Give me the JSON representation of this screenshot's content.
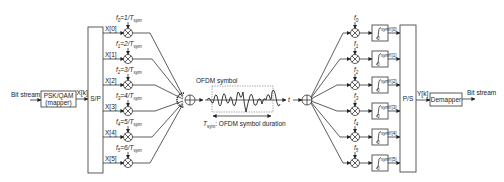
{
  "diagram": {
    "transmitter": {
      "input_label": "Bit stream",
      "mapper_line1": "PSK/QAM",
      "mapper_line2": "(mapper)",
      "mapper_output": "X[k]",
      "sp_label": "S/P",
      "subcarriers": [
        {
          "input": "X[0]",
          "freq": "f",
          "sub": "0",
          "eq": "=1/T",
          "tsub": "sym"
        },
        {
          "input": "X[1]",
          "freq": "f",
          "sub": "1",
          "eq": "=2/T",
          "tsub": "sym"
        },
        {
          "input": "X[2]",
          "freq": "f",
          "sub": "2",
          "eq": "=3/T",
          "tsub": "sym"
        },
        {
          "input": "X[3]",
          "freq": "f",
          "sub": "3",
          "eq": "=4/T",
          "tsub": "sym"
        },
        {
          "input": "X[4]",
          "freq": "f",
          "sub": "4",
          "eq": "=5/T",
          "tsub": "sym"
        },
        {
          "input": "X[5]",
          "freq": "f",
          "sub": "5",
          "eq": "=6/T",
          "tsub": "sym"
        }
      ]
    },
    "channel": {
      "symbol_label": "OFDM symbol",
      "duration_T": "T",
      "duration_sub": "sym",
      "duration_text": ": OFDM symbol duration",
      "time_axis": "t"
    },
    "receiver": {
      "subcarriers": [
        {
          "freq": "f",
          "sub": "0",
          "output": "Y[0]"
        },
        {
          "freq": "f",
          "sub": "1",
          "output": "Y[1]"
        },
        {
          "freq": "f",
          "sub": "2",
          "output": "Y[2]"
        },
        {
          "freq": "f",
          "sub": "3",
          "output": "Y[3]"
        },
        {
          "freq": "f",
          "sub": "4",
          "output": "Y[4]"
        },
        {
          "freq": "f",
          "sub": "5",
          "output": "Y[5]"
        }
      ],
      "integrator_upper": "T",
      "integrator_upper_sub": "sym",
      "integrator_lower": "0",
      "ps_label": "P/S",
      "ps_output": "Y[k]",
      "demapper_label": "Demapper",
      "output_label": "Bit stream"
    }
  }
}
